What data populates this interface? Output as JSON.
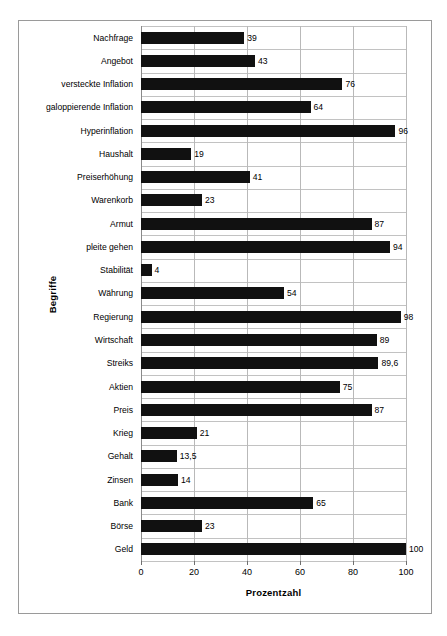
{
  "chart_data": {
    "type": "bar",
    "orientation": "horizontal",
    "title": "",
    "xlabel": "Prozentzahl",
    "ylabel": "Begriffe",
    "xlim": [
      0,
      100
    ],
    "xticks": [
      0,
      20,
      40,
      60,
      80,
      100
    ],
    "xtick_labels": [
      "0",
      "20",
      "40",
      "60",
      "80",
      "100"
    ],
    "grid": true,
    "legend": false,
    "bar_color": "#111111",
    "categories": [
      "Nachfrage",
      "Angebot",
      "versteckte Inflation",
      "galoppierende Inflation",
      "Hyperinflation",
      "Haushalt",
      "Preiserhöhung",
      "Warenkorb",
      "Armut",
      "pleite gehen",
      "Stabilität",
      "Währung",
      "Regierung",
      "Wirtschaft",
      "Streiks",
      "Aktien",
      "Preis",
      "Krieg",
      "Gehalt",
      "Zinsen",
      "Bank",
      "Börse",
      "Geld"
    ],
    "values": [
      39,
      43,
      76,
      64,
      96,
      19,
      41,
      23,
      87,
      94,
      4,
      54,
      98,
      89,
      89.6,
      75,
      87,
      21,
      13.5,
      14,
      65,
      23,
      100
    ],
    "value_labels": [
      "39",
      "43",
      "76",
      "64",
      "96",
      "19",
      "41",
      "23",
      "87",
      "94",
      "4",
      "54",
      "98",
      "89",
      "89,6",
      "75",
      "87",
      "21",
      "13,5",
      "14",
      "65",
      "23",
      "100"
    ]
  },
  "caption": ""
}
